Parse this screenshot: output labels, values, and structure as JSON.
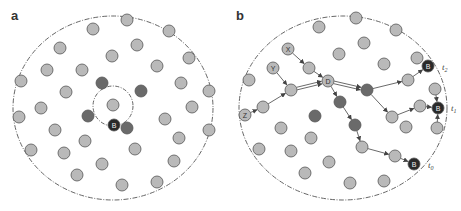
{
  "colors": {
    "node_light": "#b9b9b9",
    "node_dark": "#6a6a6a",
    "node_black": "#2a2a2a",
    "stroke": "#555555",
    "boundary": "#555555",
    "arrow": "#444444"
  },
  "panels": [
    {
      "label": "a",
      "label_pos": [
        11,
        20
      ],
      "boundary": {
        "cx": 113,
        "cy": 108,
        "rx": 100,
        "ry": 92
      },
      "inner_circle": {
        "cx": 113,
        "cy": 106,
        "r": 20
      },
      "nodes": [
        {
          "x": 127,
          "y": 20,
          "t": "light"
        },
        {
          "x": 93,
          "y": 29,
          "t": "light"
        },
        {
          "x": 169,
          "y": 31,
          "t": "light"
        },
        {
          "x": 137,
          "y": 45,
          "t": "light"
        },
        {
          "x": 60,
          "y": 48,
          "t": "light"
        },
        {
          "x": 112,
          "y": 56,
          "t": "light"
        },
        {
          "x": 189,
          "y": 58,
          "t": "light"
        },
        {
          "x": 157,
          "y": 66,
          "t": "light"
        },
        {
          "x": 47,
          "y": 70,
          "t": "light"
        },
        {
          "x": 82,
          "y": 70,
          "t": "light"
        },
        {
          "x": 21,
          "y": 81,
          "t": "light"
        },
        {
          "x": 181,
          "y": 83,
          "t": "light"
        },
        {
          "x": 66,
          "y": 92,
          "t": "light"
        },
        {
          "x": 209,
          "y": 91,
          "t": "light"
        },
        {
          "x": 41,
          "y": 108,
          "t": "light"
        },
        {
          "x": 113,
          "y": 105,
          "t": "light"
        },
        {
          "x": 192,
          "y": 107,
          "t": "light"
        },
        {
          "x": 19,
          "y": 117,
          "t": "light"
        },
        {
          "x": 165,
          "y": 119,
          "t": "light"
        },
        {
          "x": 55,
          "y": 130,
          "t": "light"
        },
        {
          "x": 209,
          "y": 130,
          "t": "light"
        },
        {
          "x": 179,
          "y": 138,
          "t": "light"
        },
        {
          "x": 85,
          "y": 141,
          "t": "light"
        },
        {
          "x": 31,
          "y": 150,
          "t": "light"
        },
        {
          "x": 135,
          "y": 149,
          "t": "light"
        },
        {
          "x": 64,
          "y": 153,
          "t": "light"
        },
        {
          "x": 174,
          "y": 161,
          "t": "light"
        },
        {
          "x": 102,
          "y": 164,
          "t": "light"
        },
        {
          "x": 77,
          "y": 175,
          "t": "light"
        },
        {
          "x": 122,
          "y": 185,
          "t": "light"
        },
        {
          "x": 157,
          "y": 182,
          "t": "light"
        },
        {
          "x": 102,
          "y": 83,
          "t": "dark"
        },
        {
          "x": 141,
          "y": 91,
          "t": "dark"
        },
        {
          "x": 88,
          "y": 116,
          "t": "dark"
        },
        {
          "x": 127,
          "y": 128,
          "t": "dark"
        },
        {
          "x": 114,
          "y": 125,
          "t": "black",
          "label": "B"
        }
      ],
      "edges": [],
      "time_labels": []
    },
    {
      "label": "b",
      "label_pos": [
        236,
        20
      ],
      "boundary": {
        "cx": 343,
        "cy": 108,
        "rx": 104,
        "ry": 92
      },
      "inner_circle": null,
      "nodes": [
        {
          "x": 356,
          "y": 18,
          "t": "light"
        },
        {
          "x": 319,
          "y": 27,
          "t": "light"
        },
        {
          "x": 396,
          "y": 30,
          "t": "light"
        },
        {
          "x": 364,
          "y": 43,
          "t": "light"
        },
        {
          "x": 339,
          "y": 54,
          "t": "light"
        },
        {
          "x": 384,
          "y": 64,
          "t": "light"
        },
        {
          "x": 417,
          "y": 58,
          "t": "light"
        },
        {
          "x": 249,
          "y": 80,
          "t": "light"
        },
        {
          "x": 435,
          "y": 89,
          "t": "light"
        },
        {
          "x": 281,
          "y": 128,
          "t": "light"
        },
        {
          "x": 406,
          "y": 127,
          "t": "light"
        },
        {
          "x": 437,
          "y": 128,
          "t": "light"
        },
        {
          "x": 311,
          "y": 138,
          "t": "light"
        },
        {
          "x": 259,
          "y": 149,
          "t": "light"
        },
        {
          "x": 291,
          "y": 151,
          "t": "light"
        },
        {
          "x": 329,
          "y": 162,
          "t": "light"
        },
        {
          "x": 305,
          "y": 173,
          "t": "light"
        },
        {
          "x": 350,
          "y": 183,
          "t": "light"
        },
        {
          "x": 384,
          "y": 181,
          "t": "light"
        },
        {
          "x": 288,
          "y": 49,
          "t": "light",
          "label": "X"
        },
        {
          "x": 309,
          "y": 68,
          "t": "light"
        },
        {
          "x": 273,
          "y": 68,
          "t": "light",
          "label": "Y"
        },
        {
          "x": 291,
          "y": 90,
          "t": "light"
        },
        {
          "x": 245,
          "y": 115,
          "t": "light",
          "label": "Z"
        },
        {
          "x": 263,
          "y": 107,
          "t": "light"
        },
        {
          "x": 328,
          "y": 81,
          "t": "light",
          "label": "D"
        },
        {
          "x": 367,
          "y": 90,
          "t": "dark"
        },
        {
          "x": 340,
          "y": 102,
          "t": "dark"
        },
        {
          "x": 355,
          "y": 125,
          "t": "dark"
        },
        {
          "x": 315,
          "y": 116,
          "t": "dark"
        },
        {
          "x": 408,
          "y": 80,
          "t": "light"
        },
        {
          "x": 392,
          "y": 117,
          "t": "light"
        },
        {
          "x": 420,
          "y": 106,
          "t": "light"
        },
        {
          "x": 362,
          "y": 147,
          "t": "light"
        },
        {
          "x": 395,
          "y": 156,
          "t": "light"
        },
        {
          "x": 428,
          "y": 66,
          "t": "black",
          "label": "B"
        },
        {
          "x": 438,
          "y": 108,
          "t": "black",
          "label": "B"
        },
        {
          "x": 414,
          "y": 164,
          "t": "black",
          "label": "B"
        }
      ],
      "edges": [
        {
          "from": [
            288,
            49
          ],
          "to": [
            309,
            68
          ],
          "double": false
        },
        {
          "from": [
            309,
            68
          ],
          "to": [
            328,
            81
          ],
          "double": false
        },
        {
          "from": [
            273,
            68
          ],
          "to": [
            291,
            90
          ],
          "double": false
        },
        {
          "from": [
            245,
            115
          ],
          "to": [
            263,
            107
          ],
          "double": false
        },
        {
          "from": [
            263,
            107
          ],
          "to": [
            291,
            90
          ],
          "double": false
        },
        {
          "from": [
            291,
            90
          ],
          "to": [
            328,
            81
          ],
          "double": true
        },
        {
          "from": [
            328,
            81
          ],
          "to": [
            367,
            90
          ],
          "double": true
        },
        {
          "from": [
            328,
            81
          ],
          "to": [
            340,
            102
          ],
          "double": false
        },
        {
          "from": [
            340,
            102
          ],
          "to": [
            355,
            125
          ],
          "double": false
        },
        {
          "from": [
            355,
            125
          ],
          "to": [
            362,
            147
          ],
          "double": false
        },
        {
          "from": [
            362,
            147
          ],
          "to": [
            395,
            156
          ],
          "double": false
        },
        {
          "from": [
            395,
            156
          ],
          "to": [
            414,
            164
          ],
          "double": false
        },
        {
          "from": [
            367,
            90
          ],
          "to": [
            408,
            80
          ],
          "double": false
        },
        {
          "from": [
            408,
            80
          ],
          "to": [
            428,
            66
          ],
          "double": false
        },
        {
          "from": [
            367,
            90
          ],
          "to": [
            392,
            117
          ],
          "double": false
        },
        {
          "from": [
            392,
            117
          ],
          "to": [
            420,
            106
          ],
          "double": false
        },
        {
          "from": [
            420,
            106
          ],
          "to": [
            438,
            108
          ],
          "double": false
        },
        {
          "from": [
            435,
            89
          ],
          "to": [
            438,
            108
          ],
          "double": false
        },
        {
          "from": [
            437,
            128
          ],
          "to": [
            438,
            108
          ],
          "double": false
        }
      ],
      "time_labels": [
        {
          "text": "t",
          "sub": "2",
          "x": 442,
          "y": 70
        },
        {
          "text": "t",
          "sub": "1",
          "x": 451,
          "y": 111
        },
        {
          "text": "t",
          "sub": "0",
          "x": 428,
          "y": 168
        }
      ]
    }
  ]
}
